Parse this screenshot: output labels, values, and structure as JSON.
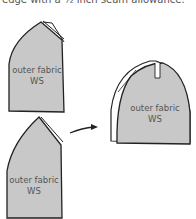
{
  "caption": "edge with a ½ inch seam allowance.",
  "pieces": [
    {
      "id": "piece-top-left",
      "label_line1": "outer fabric",
      "label_line2": "WS"
    },
    {
      "id": "piece-bottom-left",
      "label_line1": "outer fabric",
      "label_line2": "WS"
    },
    {
      "id": "piece-result",
      "label_line1": "outer fabric",
      "label_line2": "WS"
    }
  ],
  "colors": {
    "fabric_fill": "#c8c8c8",
    "outline": "#222222",
    "label_text": "#555555"
  },
  "arrow": {
    "direction": "right",
    "semantic": "arrow-right-icon"
  }
}
